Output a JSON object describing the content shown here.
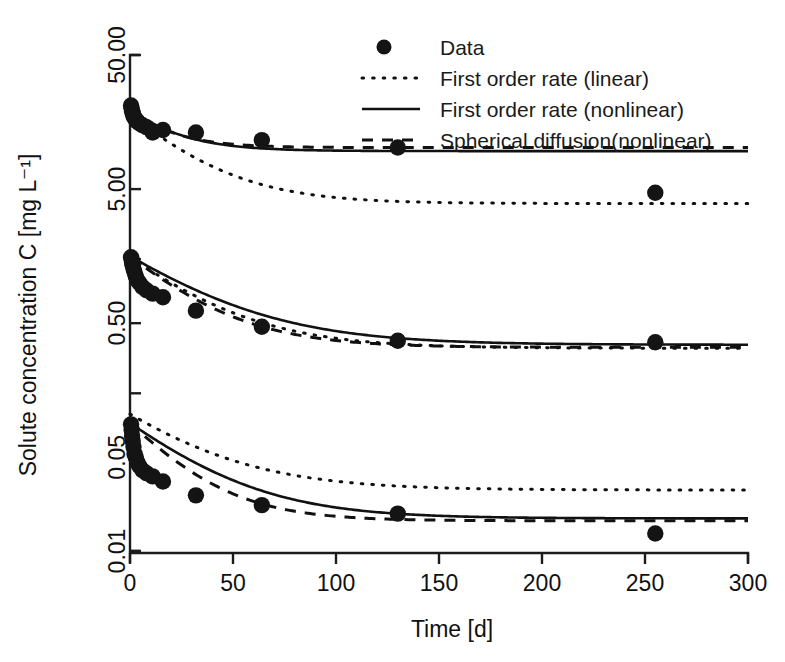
{
  "chart_data": {
    "type": "scatter",
    "title": "",
    "xlabel": "Time [d]",
    "ylabel": "Solute concentration C [mg L⁻¹]",
    "xlim": [
      0,
      300
    ],
    "ylim": [
      0.01,
      50.0
    ],
    "yscale": "log",
    "xscale": "linear",
    "grid": false,
    "legend_position": "top-right",
    "xticks": [
      0,
      50,
      100,
      150,
      200,
      250,
      300
    ],
    "xtick_labels": [
      "0",
      "50",
      "100",
      "150",
      "200",
      "250",
      "300"
    ],
    "yticks": [
      50.0,
      5.0,
      0.5,
      0.05,
      0.01
    ],
    "ytick_labels": [
      "50.00",
      "5.00",
      "0.50",
      "0.05",
      "0.01"
    ],
    "yminor_ticks": [
      15.0,
      1.5,
      0.15
    ],
    "legend": [
      {
        "label": "Data",
        "style": "marker",
        "marker": "filled-circle"
      },
      {
        "label": "First order rate (linear)",
        "style": "dotted"
      },
      {
        "label": "First order rate (nonlinear)",
        "style": "solid"
      },
      {
        "label": "Spherical diffusion(nonlinear)",
        "style": "dashed"
      }
    ],
    "groups": [
      {
        "name": "high-concentration",
        "data_points": [
          {
            "x": 0.5,
            "y": 21.0
          },
          {
            "x": 0.8,
            "y": 20.0
          },
          {
            "x": 1.0,
            "y": 19.0
          },
          {
            "x": 1.3,
            "y": 18.5
          },
          {
            "x": 1.7,
            "y": 17.5
          },
          {
            "x": 2.2,
            "y": 17.0
          },
          {
            "x": 2.8,
            "y": 16.5
          },
          {
            "x": 3.5,
            "y": 16.0
          },
          {
            "x": 4.5,
            "y": 15.5
          },
          {
            "x": 6.0,
            "y": 15.0
          },
          {
            "x": 8.0,
            "y": 14.5
          },
          {
            "x": 11.0,
            "y": 13.2
          },
          {
            "x": 16.0,
            "y": 13.8
          },
          {
            "x": 32.0,
            "y": 13.2
          },
          {
            "x": 64.0,
            "y": 11.6
          },
          {
            "x": 130.0,
            "y": 10.2
          },
          {
            "x": 255.0,
            "y": 4.7
          }
        ],
        "first_order_linear": {
          "c0": 18.0,
          "c_inf": 3.9,
          "k": 0.035
        },
        "first_order_nonlinear": {
          "c0": 19.5,
          "c_inf": 9.6,
          "k": 0.048
        },
        "spherical_diffusion": {
          "c0": 19.5,
          "c_inf": 10.2,
          "k": 0.055
        }
      },
      {
        "name": "medium-concentration",
        "data_points": [
          {
            "x": 0.5,
            "y": 1.55
          },
          {
            "x": 0.8,
            "y": 1.5
          },
          {
            "x": 1.0,
            "y": 1.42
          },
          {
            "x": 1.3,
            "y": 1.35
          },
          {
            "x": 1.7,
            "y": 1.28
          },
          {
            "x": 2.2,
            "y": 1.2
          },
          {
            "x": 2.8,
            "y": 1.12
          },
          {
            "x": 3.5,
            "y": 1.05
          },
          {
            "x": 4.5,
            "y": 1.0
          },
          {
            "x": 6.0,
            "y": 0.93
          },
          {
            "x": 8.0,
            "y": 0.88
          },
          {
            "x": 11.0,
            "y": 0.83
          },
          {
            "x": 16.0,
            "y": 0.78
          },
          {
            "x": 32.0,
            "y": 0.62
          },
          {
            "x": 64.0,
            "y": 0.47
          },
          {
            "x": 130.0,
            "y": 0.37
          },
          {
            "x": 255.0,
            "y": 0.36
          }
        ],
        "first_order_linear": {
          "c0": 1.55,
          "c_inf": 0.325,
          "k": 0.03
        },
        "first_order_nonlinear": {
          "c0": 1.58,
          "c_inf": 0.345,
          "k": 0.026
        },
        "spherical_diffusion": {
          "c0": 1.58,
          "c_inf": 0.33,
          "k": 0.034
        }
      },
      {
        "name": "low-concentration",
        "data_points": [
          {
            "x": 0.5,
            "y": 0.088
          },
          {
            "x": 0.8,
            "y": 0.08
          },
          {
            "x": 1.0,
            "y": 0.072
          },
          {
            "x": 1.3,
            "y": 0.066
          },
          {
            "x": 1.7,
            "y": 0.06
          },
          {
            "x": 2.2,
            "y": 0.053
          },
          {
            "x": 2.8,
            "y": 0.05
          },
          {
            "x": 3.5,
            "y": 0.046
          },
          {
            "x": 4.5,
            "y": 0.043
          },
          {
            "x": 6.0,
            "y": 0.04
          },
          {
            "x": 8.0,
            "y": 0.038
          },
          {
            "x": 11.0,
            "y": 0.036
          },
          {
            "x": 16.0,
            "y": 0.033
          },
          {
            "x": 32.0,
            "y": 0.026
          },
          {
            "x": 64.0,
            "y": 0.022
          },
          {
            "x": 130.0,
            "y": 0.019
          },
          {
            "x": 255.0,
            "y": 0.0135
          }
        ],
        "first_order_linear": {
          "c0": 0.105,
          "c_inf": 0.0285,
          "k": 0.028
        },
        "first_order_nonlinear": {
          "c0": 0.09,
          "c_inf": 0.0175,
          "k": 0.03
        },
        "spherical_diffusion": {
          "c0": 0.09,
          "c_inf": 0.0168,
          "k": 0.04
        }
      }
    ]
  },
  "axes": {
    "x_title": "Time [d]",
    "y_title": "Solute concentration C [mg L⁻¹]"
  },
  "legend": {
    "item_0": "Data",
    "item_1": "First order rate (linear)",
    "item_2": "First order rate (nonlinear)",
    "item_3": "Spherical diffusion(nonlinear)"
  },
  "colors": {
    "ink": "#111111",
    "background": "#ffffff"
  }
}
